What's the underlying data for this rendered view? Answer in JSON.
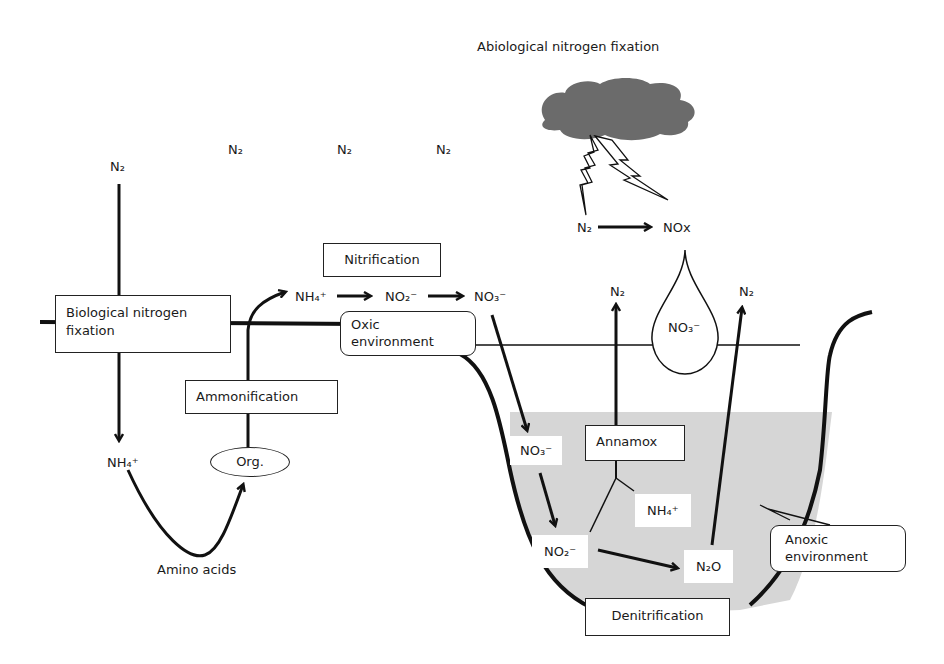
{
  "title": "Abiological nitrogen fixation",
  "atmosphere": {
    "n2_labels": [
      "N₂",
      "N₂",
      "N₂",
      "N₂"
    ]
  },
  "lightning": {
    "source": "N₂",
    "product": "NOx",
    "droplet": "NO₃⁻"
  },
  "boxes": {
    "biological_fixation": "Biological nitrogen fixation",
    "nitrification": "Nitrification",
    "oxic": "Oxic environment",
    "ammonification": "Ammonification",
    "org": "Org.",
    "annamox": "Annamox",
    "anoxic": "Anoxic environment",
    "denitrification": "Denitrification"
  },
  "species": {
    "nh4_left": "NH₄⁺",
    "amino_acids": "Amino acids",
    "nh4_nitrif": "NH₄⁺",
    "no2_nitrif": "NO₂⁻",
    "no3_nitrif": "NO₃⁻",
    "n2_annamox": "N₂",
    "n2_denit": "N₂",
    "no3_anoxic": "NO₃⁻",
    "nh4_anoxic": "NH₄⁺",
    "no2_anoxic": "NO₂⁻",
    "n2o_anoxic": "N₂O"
  },
  "colors": {
    "line": "#111111",
    "cloud": "#6b6b6b",
    "anoxic_fill": "#d6d6d6"
  }
}
